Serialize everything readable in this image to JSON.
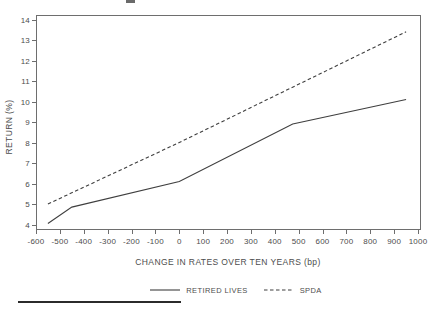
{
  "chart_data": {
    "type": "line",
    "title": "",
    "xlabel": "CHANGE IN RATES OVER TEN YEARS (bp)",
    "ylabel": "RETURN (%)",
    "xlim": [
      -600,
      1000
    ],
    "ylim": [
      4,
      14
    ],
    "x_ticks": [
      -600,
      -500,
      -400,
      -300,
      -200,
      -100,
      0,
      100,
      200,
      300,
      400,
      500,
      600,
      700,
      800,
      900,
      1000
    ],
    "y_ticks": [
      4,
      5,
      6,
      7,
      8,
      9,
      10,
      11,
      12,
      13,
      14
    ],
    "grid": false,
    "frame": true,
    "legend_position": "bottom-center",
    "axis_color": "#6e6e6e",
    "text_color": "#4d4d4d",
    "series": [
      {
        "name": "RETIRED LIVES",
        "line_style": "solid",
        "color": "#3f3f3f",
        "points": [
          [
            -550,
            4.05
          ],
          [
            -450,
            4.85
          ],
          [
            0,
            6.1
          ],
          [
            475,
            8.9
          ],
          [
            950,
            10.1
          ]
        ]
      },
      {
        "name": "SPDA",
        "line_style": "dashed",
        "color": "#3f3f3f",
        "points": [
          [
            -550,
            5.0
          ],
          [
            0,
            8.0
          ],
          [
            950,
            13.4
          ]
        ]
      }
    ]
  }
}
